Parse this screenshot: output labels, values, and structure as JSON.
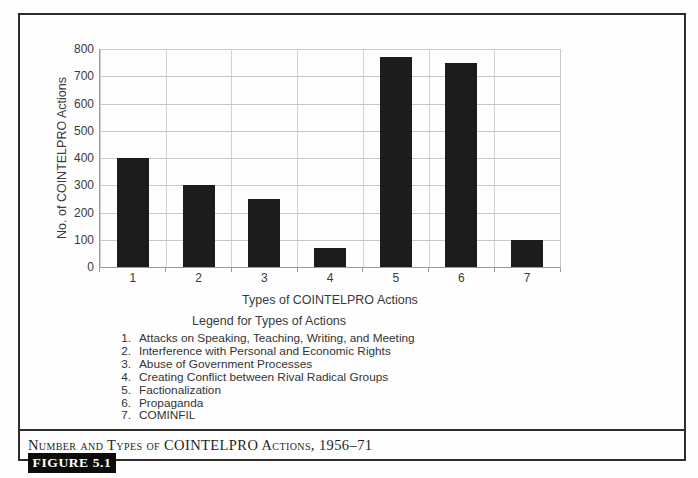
{
  "figure": {
    "caption": "Number and Types of COINTELPRO Actions, 1956–71",
    "label": "FIGURE 5.1"
  },
  "chart_data": {
    "type": "bar",
    "categories": [
      "1",
      "2",
      "3",
      "4",
      "5",
      "6",
      "7"
    ],
    "values": [
      400,
      300,
      250,
      70,
      770,
      750,
      100
    ],
    "title": "",
    "xlabel": "Types of COINTELPRO Actions",
    "ylabel": "No. of COINTELPRO Actions",
    "ylim": [
      0,
      800
    ],
    "y_ticks": [
      800,
      700,
      600,
      500,
      400,
      300,
      200,
      100,
      0
    ],
    "grid": true,
    "legend_position": "below",
    "bar_color": "#1c1c1c",
    "gridline_color": "#c8c8c8"
  },
  "legend": {
    "heading": "Legend for Types of Actions",
    "items": [
      {
        "num": "1.",
        "text": "Attacks on Speaking, Teaching, Writing, and Meeting"
      },
      {
        "num": "2.",
        "text": "Interference with Personal and Economic Rights"
      },
      {
        "num": "3.",
        "text": "Abuse of Government Processes"
      },
      {
        "num": "4.",
        "text": "Creating Conflict between Rival Radical Groups"
      },
      {
        "num": "5.",
        "text": "Factionalization"
      },
      {
        "num": "6.",
        "text": "Propaganda"
      },
      {
        "num": "7.",
        "text": "COMINFIL"
      }
    ]
  }
}
